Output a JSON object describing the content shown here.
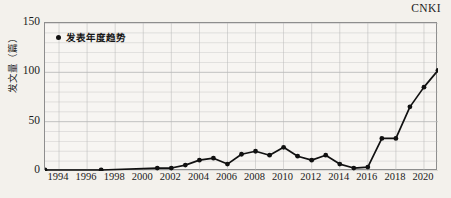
{
  "source": {
    "label": "CNKI"
  },
  "legend": {
    "marker_icon": "dot-marker-icon",
    "label": "发表年度趋势",
    "position": "top-left-inside"
  },
  "axes": {
    "y_title": "发文量（篇）",
    "y_ticks": [
      "0",
      "50",
      "100",
      "150"
    ],
    "y_tick_values": [
      0,
      50,
      100,
      150
    ],
    "x_ticks": [
      "1994",
      "1996",
      "1998",
      "2000",
      "2002",
      "2004",
      "2006",
      "2008",
      "2010",
      "2012",
      "2014",
      "2016",
      "2018",
      "2020"
    ],
    "x_tick_values": [
      1994,
      1996,
      1998,
      2000,
      2002,
      2004,
      2006,
      2008,
      2010,
      2012,
      2014,
      2016,
      2018,
      2020
    ]
  },
  "style": {
    "line_color": "#111111",
    "marker_color": "#111111",
    "grid_color": "#b9b9b9",
    "frame_color": "#8e8e8e",
    "background": "#f3f1ec"
  },
  "chart_data": {
    "type": "line",
    "title": "",
    "subtitle": "",
    "xlabel": "",
    "ylabel": "发文量（篇）",
    "xlim": [
      1993,
      2021
    ],
    "ylim": [
      0,
      150
    ],
    "grid": true,
    "grid_major_y": [
      0,
      50,
      100,
      150
    ],
    "grid_minor_y_step": 10,
    "grid_x_step": 2,
    "legend": [
      "发表年度趋势"
    ],
    "legend_position": "top-left",
    "annotations": [
      "CNKI"
    ],
    "x": [
      1993,
      1997,
      2001,
      2002,
      2003,
      2004,
      2005,
      2006,
      2007,
      2008,
      2009,
      2010,
      2011,
      2012,
      2013,
      2014,
      2015,
      2016,
      2017,
      2018,
      2019,
      2020,
      2021
    ],
    "series": [
      {
        "name": "发表年度趋势",
        "values": [
          1,
          1,
          3,
          3,
          6,
          11,
          13,
          7,
          17,
          20,
          16,
          24,
          15,
          11,
          16,
          7,
          3,
          4,
          33,
          33,
          65,
          85,
          102
        ]
      }
    ]
  }
}
